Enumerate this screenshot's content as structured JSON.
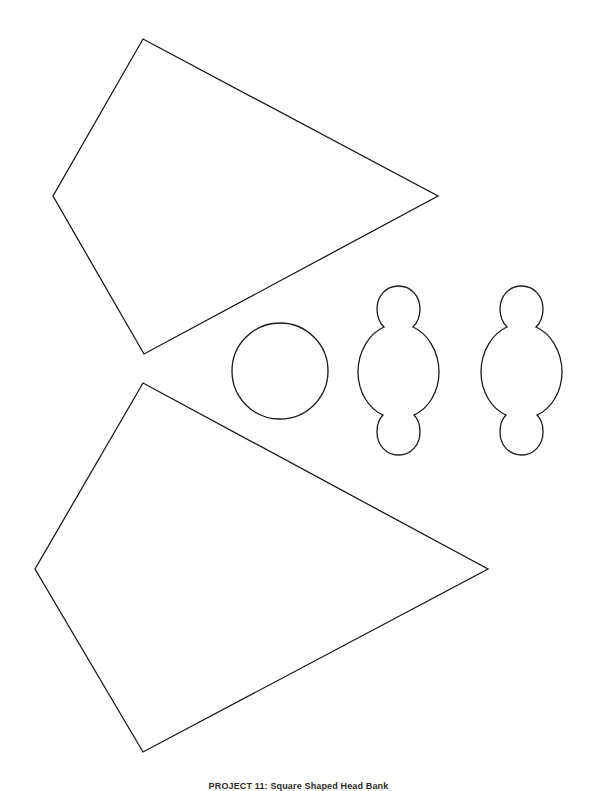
{
  "page": {
    "background_color": "#ffffff",
    "line_color": "#1a1a1a",
    "width": 597,
    "height": 791
  },
  "caption": {
    "text": "PROJECT 11: Square Shaped Head Bank",
    "visible_note": "clipped at bottom edge"
  },
  "shapes": [
    {
      "name": "quadrilateral-top",
      "type": "polygon",
      "label": "Large kite quadrilateral (upper)",
      "points": "143,39 438,196 144,354 53,196"
    },
    {
      "name": "circle-middle",
      "type": "circle",
      "label": "Plain circle",
      "cx": 280,
      "cy": 371,
      "r": 48
    },
    {
      "name": "figure-shape-left",
      "type": "path",
      "label": "Figure outline with head, body and foot (left)",
      "d": "M 398.5 286 C 386 286 377 296 377 309 C 377 317 380 323 384 327 C 370 333 358 351 358 372 C 358 392 369 409 383 415 C 379 419 377 425 377 432 C 377 445 386 455 398.5 455 C 411 455 420 445 420 432 C 420 425 418 419 414 415 C 428 409 439 392 439 372 C 439 351 427 333 413 327 C 417 323 420 317 420 309 C 420 296 411 286 398.5 286 Z"
    },
    {
      "name": "figure-shape-right",
      "type": "path",
      "label": "Figure outline with head, body and foot (right)",
      "d": "M 521.5 286 C 509 286 500 296 500 309 C 500 317 503 323 507 327 C 493 333 481 351 481 372 C 481 392 492 409 506 415 C 502 419 500 425 500 432 C 500 445 509 455 521.5 455 C 534 455 543 445 543 432 C 543 425 541 419 537 415 C 551 409 562 392 562 372 C 562 351 550 333 536 327 C 540 323 543 317 543 309 C 543 296 534 286 521.5 286 Z"
    },
    {
      "name": "quadrilateral-bottom",
      "type": "polygon",
      "label": "Large kite quadrilateral (lower)",
      "points": "143,383 488,569 143,752 35,569"
    }
  ]
}
